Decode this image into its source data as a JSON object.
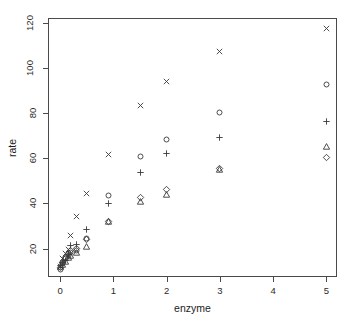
{
  "chart_data": {
    "type": "scatter",
    "title": "",
    "xlabel": "enzyme",
    "ylabel": "rate",
    "xlim": [
      -0.23,
      5.2
    ],
    "ylim": [
      7.5,
      122
    ],
    "xticks": [
      0,
      1,
      2,
      3,
      4,
      5
    ],
    "yticks": [
      20,
      40,
      60,
      80,
      100,
      120
    ],
    "xticklabels": [
      "0",
      "1",
      "2",
      "3",
      "4",
      "5"
    ],
    "yticklabels": [
      "20",
      "40",
      "60",
      "80",
      "100",
      "120"
    ],
    "grid": false,
    "legend": "none",
    "point_color": "#3a3a3a",
    "x": [
      0,
      0.05,
      0.1,
      0.15,
      0.2,
      0.3,
      0.5,
      0.9,
      1.5,
      2,
      3,
      5
    ],
    "series": [
      {
        "name": "circle",
        "marker": "circle",
        "values": [
          11.0,
          13.5,
          15.5,
          17.0,
          18.5,
          19.0,
          24.5,
          43.5,
          60.8,
          68.2,
          80.3,
          92.8
        ]
      },
      {
        "name": "triangle",
        "marker": "triangle",
        "values": [
          12.0,
          13.0,
          14.5,
          16.0,
          17.0,
          18.3,
          21.0,
          32.0,
          41.0,
          44.0,
          55.0,
          65.0
        ]
      },
      {
        "name": "plus",
        "marker": "plus",
        "values": [
          12.5,
          14.0,
          15.0,
          17.5,
          21.5,
          22.0,
          28.3,
          40.2,
          53.5,
          62.3,
          69.2,
          76.2
        ]
      },
      {
        "name": "cross",
        "marker": "cross",
        "values": [
          12.3,
          15.5,
          18.0,
          19.5,
          26.0,
          34.3,
          44.5,
          61.5,
          83.3,
          94.0,
          107.0,
          117.3
        ]
      },
      {
        "name": "diamond",
        "marker": "diamond",
        "values": [
          11.5,
          13.8,
          16.0,
          17.8,
          19.0,
          20.0,
          24.0,
          32.2,
          42.5,
          46.0,
          55.3,
          60.2
        ]
      }
    ]
  },
  "axes": {
    "x_title": "enzyme",
    "y_title": "rate"
  }
}
